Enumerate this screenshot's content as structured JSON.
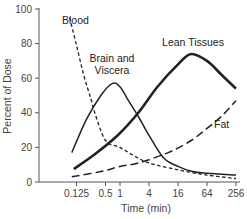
{
  "chart_data": {
    "type": "line",
    "title": "",
    "xlabel": "Time (min)",
    "ylabel": "Percent of Dose",
    "x_scale": "log2",
    "xlim": [
      0.07,
      300
    ],
    "ylim": [
      0,
      100
    ],
    "grid": false,
    "legend": "inline labels",
    "x_ticks": [
      {
        "value": 0.125,
        "label": "0.125"
      },
      {
        "value": 0.5,
        "label": "0.5"
      },
      {
        "value": 1,
        "label": "1"
      },
      {
        "value": 4,
        "label": "4"
      },
      {
        "value": 16,
        "label": "16"
      },
      {
        "value": 64,
        "label": "64"
      },
      {
        "value": 256,
        "label": "256"
      }
    ],
    "y_ticks": [
      {
        "value": 0,
        "label": "0"
      },
      {
        "value": 20,
        "label": "20"
      },
      {
        "value": 40,
        "label": "40"
      },
      {
        "value": 60,
        "label": "60"
      },
      {
        "value": 80,
        "label": "80"
      },
      {
        "value": 100,
        "label": "100"
      }
    ],
    "series": [
      {
        "name": "Blood",
        "style": "short-dash",
        "color": "#222222",
        "width": 1.3,
        "label_pos": {
          "x": 62,
          "y": 24
        },
        "points": [
          [
            0.09,
            95
          ],
          [
            0.125,
            79
          ],
          [
            0.18,
            61
          ],
          [
            0.25,
            48
          ],
          [
            0.3,
            40
          ],
          [
            0.5,
            24
          ],
          [
            1,
            20
          ],
          [
            2,
            15
          ],
          [
            4,
            11
          ],
          [
            16,
            7
          ],
          [
            64,
            4
          ],
          [
            256,
            2
          ]
        ]
      },
      {
        "name": "Brain and Viscera",
        "label_lines": [
          "Brain and",
          "Viscera"
        ],
        "style": "solid",
        "color": "#222222",
        "width": 1.5,
        "label_pos": {
          "x": 112,
          "y": 62
        },
        "points": [
          [
            0.1,
            17
          ],
          [
            0.2,
            36
          ],
          [
            0.4,
            50
          ],
          [
            0.7,
            57
          ],
          [
            1,
            55
          ],
          [
            1.5,
            47
          ],
          [
            2.5,
            37
          ],
          [
            4,
            27
          ],
          [
            8,
            14
          ],
          [
            16,
            9
          ],
          [
            32,
            6
          ],
          [
            64,
            5
          ],
          [
            256,
            4
          ]
        ]
      },
      {
        "name": "Lean Tissues",
        "style": "solid-thick",
        "color": "#222222",
        "width": 2.6,
        "label_pos": {
          "x": 193,
          "y": 46
        },
        "points": [
          [
            0.11,
            7.5
          ],
          [
            0.3,
            16
          ],
          [
            0.9,
            27
          ],
          [
            2.4,
            40
          ],
          [
            6,
            55
          ],
          [
            16,
            68
          ],
          [
            30,
            74
          ],
          [
            64,
            70
          ],
          [
            128,
            62
          ],
          [
            256,
            54
          ]
        ]
      },
      {
        "name": "Fat",
        "style": "long-dash",
        "color": "#222222",
        "width": 1.5,
        "label_pos": {
          "x": 214,
          "y": 128
        },
        "points": [
          [
            0.1,
            3
          ],
          [
            0.4,
            6
          ],
          [
            1,
            9
          ],
          [
            2.4,
            11
          ],
          [
            10,
            17
          ],
          [
            30,
            24
          ],
          [
            64,
            31
          ],
          [
            128,
            38
          ],
          [
            256,
            47
          ]
        ]
      }
    ]
  }
}
